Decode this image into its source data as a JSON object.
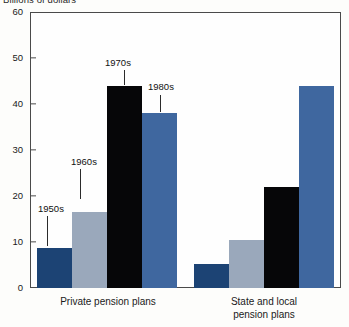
{
  "chart_data": {
    "type": "bar",
    "title": "Billions of dollars",
    "xlabel": "",
    "ylabel": "Billions of dollars",
    "ylim": [
      0,
      60
    ],
    "yticks": [
      0,
      10,
      20,
      30,
      40,
      50,
      60
    ],
    "ytick_labels": [
      "0",
      "10",
      "20",
      "30",
      "40",
      "50",
      "60"
    ],
    "grid": false,
    "legend_position": "none",
    "categories": [
      "Private pension plans",
      "State and local pension plans"
    ],
    "series": [
      {
        "name": "1950s",
        "color": "#1c4374",
        "values": [
          8.7,
          5.3
        ]
      },
      {
        "name": "1960s",
        "color": "#9aa8bb",
        "values": [
          16.5,
          10.5
        ]
      },
      {
        "name": "1970s",
        "color": "#060608",
        "values": [
          44.0,
          22.0
        ]
      },
      {
        "name": "1980s",
        "color": "#3f679f",
        "values": [
          38.0,
          44.0
        ]
      }
    ],
    "annotations": [
      {
        "text": "1950s",
        "series": "1950s",
        "group": "Private pension plans"
      },
      {
        "text": "1960s",
        "series": "1960s",
        "group": "Private pension plans"
      },
      {
        "text": "1970s",
        "series": "1970s",
        "group": "Private pension plans"
      },
      {
        "text": "1980s",
        "series": "1980s",
        "group": "Private pension plans"
      }
    ]
  },
  "axis": {
    "y_labels": [
      "60",
      "50",
      "40",
      "30",
      "20",
      "10",
      "0"
    ]
  },
  "category_labels": {
    "private_line1": "Private pension plans",
    "state_line1": "State and local",
    "state_line2": "pension plans"
  },
  "annotations": {
    "a1950s": "1950s",
    "a1960s": "1960s",
    "a1970s": "1970s",
    "a1980s": "1980s"
  }
}
